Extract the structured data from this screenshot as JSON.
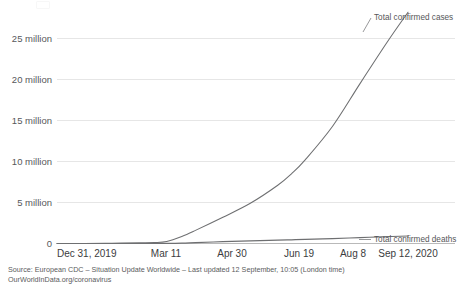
{
  "chart_data": {
    "type": "line",
    "title": "",
    "xlabel": "",
    "ylabel": "",
    "grid": true,
    "legend_position": "right-inline-labels",
    "x_tick_labels": [
      "Dec 31, 2019",
      "Mar 11",
      "Apr 30",
      "Jun 19",
      "Aug 8",
      "Sep 12, 2020"
    ],
    "y_tick_labels": [
      "0",
      "5 million",
      "10 million",
      "15 million",
      "20 million",
      "25 million"
    ],
    "y_tick_values": [
      0,
      5000000,
      10000000,
      15000000,
      20000000,
      25000000
    ],
    "ylim": [
      0,
      28500000
    ],
    "xlim": [
      "Dec 31, 2019",
      "Sep 12, 2020"
    ],
    "series": [
      {
        "name": "Total confirmed cases",
        "x": [
          "Dec 31, 2019",
          "Jan 20, 2020",
          "Feb 9, 2020",
          "Feb 29, 2020",
          "Mar 11, 2020",
          "Mar 20, 2020",
          "Mar 31, 2020",
          "Apr 10, 2020",
          "Apr 30, 2020",
          "May 20, 2020",
          "Jun 9, 2020",
          "Jun 19, 2020",
          "Jun 29, 2020",
          "Jul 19, 2020",
          "Aug 8, 2020",
          "Aug 28, 2020",
          "Sep 12, 2020"
        ],
        "values": [
          0,
          300,
          37000,
          86000,
          120000,
          250000,
          860000,
          1600000,
          3200000,
          4900000,
          7100000,
          8500000,
          10200000,
          14300000,
          19500000,
          24600000,
          28200000
        ]
      },
      {
        "name": "Total confirmed deaths",
        "x": [
          "Dec 31, 2019",
          "Jan 20, 2020",
          "Feb 9, 2020",
          "Feb 29, 2020",
          "Mar 11, 2020",
          "Mar 20, 2020",
          "Mar 31, 2020",
          "Apr 10, 2020",
          "Apr 30, 2020",
          "May 20, 2020",
          "Jun 9, 2020",
          "Jun 19, 2020",
          "Jun 29, 2020",
          "Jul 19, 2020",
          "Aug 8, 2020",
          "Aug 28, 2020",
          "Sep 12, 2020"
        ],
        "values": [
          0,
          6,
          810,
          2900,
          4300,
          10000,
          38000,
          100000,
          225000,
          325000,
          410000,
          450000,
          500000,
          600000,
          720000,
          840000,
          910000
        ]
      }
    ]
  },
  "axis": {
    "y_ticks": [
      {
        "label": "25 million"
      },
      {
        "label": "20 million"
      },
      {
        "label": "15 million"
      },
      {
        "label": "10 million"
      },
      {
        "label": "5 million"
      },
      {
        "label": "0"
      }
    ],
    "x_ticks": [
      {
        "label": "Dec 31, 2019"
      },
      {
        "label": "Mar 11"
      },
      {
        "label": "Apr 30"
      },
      {
        "label": "Jun 19"
      },
      {
        "label": "Aug 8"
      },
      {
        "label": "Sep 12, 2020"
      }
    ]
  },
  "series_labels": {
    "cases": "Total confirmed cases",
    "deaths": "Total confirmed deaths"
  },
  "footer": {
    "source_line": "Source: European CDC – Situation Update Worldwide – Last updated 12 September, 10:05 (London time)",
    "url_line": "OurWorldInData.org/coronavirus"
  },
  "colors": {
    "series_stroke": "#6e6f71",
    "gridline": "#e6e6e6",
    "axis": "#b9b9b9",
    "text": "#444444"
  }
}
